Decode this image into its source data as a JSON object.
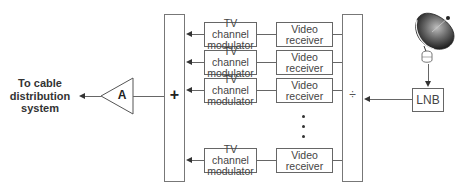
{
  "diagram": {
    "output_label": [
      "To cable",
      "distribution",
      "system"
    ],
    "amplifier": {
      "label": "A"
    },
    "combiner": {
      "symbol": "+"
    },
    "splitter": {
      "symbol": "÷"
    },
    "lnb": {
      "label": "LNB"
    },
    "dish": {
      "icon": "satellite-dish-icon"
    },
    "channels": [
      {
        "modulator": [
          "TV channel",
          "modulator"
        ],
        "receiver": [
          "Video",
          "receiver"
        ]
      },
      {
        "modulator": [
          "TV channel",
          "modulator"
        ],
        "receiver": [
          "Video",
          "receiver"
        ]
      },
      {
        "modulator": [
          "TV channel",
          "modulator"
        ],
        "receiver": [
          "Video",
          "receiver"
        ]
      },
      {
        "modulator": [
          "TV channel",
          "modulator"
        ],
        "receiver": [
          "Video",
          "receiver"
        ]
      }
    ],
    "ellipsis": "⋮",
    "colors": {
      "line": "#666666",
      "arrow": "#333333",
      "dish": "#3a3a3a"
    }
  }
}
